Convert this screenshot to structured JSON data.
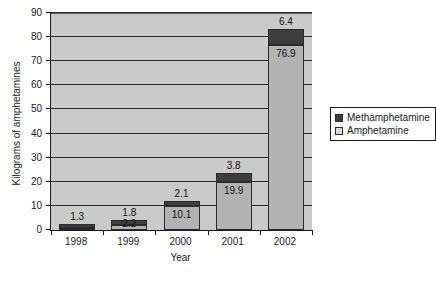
{
  "chart_data": {
    "type": "bar",
    "stacked": true,
    "title": "",
    "xlabel": "Year",
    "ylabel": "Kilograms of amphetamines",
    "categories": [
      "1998",
      "1999",
      "2000",
      "2001",
      "2002"
    ],
    "ylim": [
      0,
      90
    ],
    "yticks": [
      0,
      10,
      20,
      30,
      40,
      50,
      60,
      70,
      80,
      90
    ],
    "ytick_labels": [
      "0",
      "10",
      "20",
      "30",
      "40",
      "50",
      "60",
      "70",
      "80",
      "90"
    ],
    "grid": true,
    "grid_axis": "y",
    "legend_position": "right",
    "series": [
      {
        "name": "Amphetamine",
        "color": "#b3b3b3",
        "values": [
          1.0,
          2.2,
          10.1,
          19.9,
          76.9
        ],
        "labels": [
          "",
          "2.2",
          "10.1",
          "19.9",
          "76.9"
        ]
      },
      {
        "name": "Methamphetamine",
        "color": "#3d3d3d",
        "values": [
          1.3,
          1.8,
          2.1,
          3.8,
          6.4
        ],
        "labels": [
          "1.3",
          "1.8",
          "2.1",
          "3.8",
          "6.4"
        ]
      }
    ]
  },
  "legend": {
    "items": [
      {
        "label": "Methamphetamine",
        "swatch": "dark"
      },
      {
        "label": "Amphetamine",
        "swatch": "light"
      }
    ]
  },
  "colors": {
    "plot_background": "#c9c9c9",
    "amphetamine": "#b3b3b3",
    "methamphetamine": "#3d3d3d",
    "axis": "#1a1a1a",
    "gridline": "#2b2b2b",
    "page_background": "#ffffff"
  }
}
